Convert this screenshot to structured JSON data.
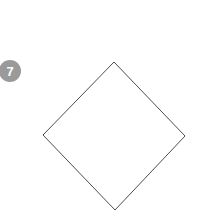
{
  "canvas": {
    "width": 206,
    "height": 224,
    "background_color": "#ffffff"
  },
  "markers": [
    {
      "label": "7",
      "icon": "numbered-circle-badge",
      "fill_color": "#9a9a9a",
      "text_color": "#ffffff",
      "center_x": 10,
      "center_y": 71,
      "diameter": 22,
      "font_size": 13,
      "clipped_edge": "left"
    }
  ],
  "shapes": [
    {
      "name": "diamond",
      "type": "polygon",
      "sides": 4,
      "stroke_color": "#4d4d4d",
      "stroke_width": 1,
      "fill_color": "none",
      "points": "114,62 185,136 115,210 43,135",
      "vertices": [
        {
          "label": "top",
          "x": 114,
          "y": 62
        },
        {
          "label": "right",
          "x": 185,
          "y": 136
        },
        {
          "label": "bottom",
          "x": 115,
          "y": 210
        },
        {
          "label": "left",
          "x": 43,
          "y": 135
        }
      ]
    }
  ]
}
